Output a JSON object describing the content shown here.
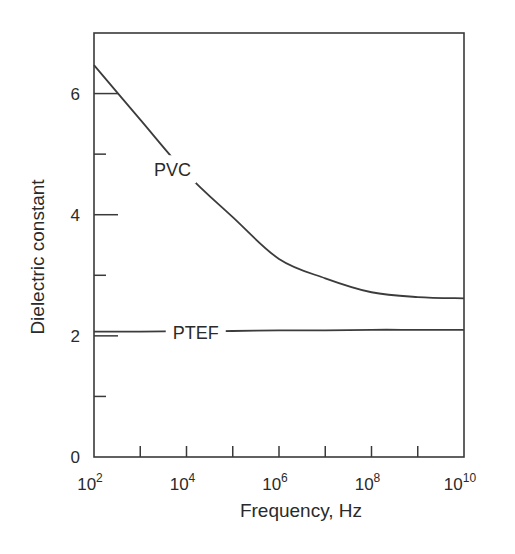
{
  "chart_data": {
    "type": "line",
    "title": "",
    "xlabel": "Frequency, Hz",
    "ylabel": "Dielectric constant",
    "xscale": "log",
    "xlim_log10": [
      2,
      10
    ],
    "ylim": [
      0,
      7
    ],
    "grid": false,
    "legend": "inline labels on curves",
    "x_ticks_log10": [
      2,
      4,
      6,
      8,
      10
    ],
    "x_minor_ticks_log10": [
      3,
      5,
      7,
      9
    ],
    "x_tick_labels": [
      {
        "base": "10",
        "exp": "2"
      },
      {
        "base": "10",
        "exp": "4"
      },
      {
        "base": "10",
        "exp": "6"
      },
      {
        "base": "10",
        "exp": "8"
      },
      {
        "base": "10",
        "exp": "10"
      }
    ],
    "y_ticks": [
      0,
      2,
      4,
      6
    ],
    "y_minor_ticks": [
      1,
      3,
      5
    ],
    "y_tick_labels": [
      "0",
      "2",
      "4",
      "6"
    ],
    "x_log10": [
      2,
      3,
      4,
      5,
      6,
      7,
      8,
      9,
      10
    ],
    "series": [
      {
        "name": "PVC",
        "values": [
          6.47,
          5.57,
          4.68,
          3.96,
          3.27,
          2.95,
          2.72,
          2.64,
          2.62
        ],
        "label_at_log10": 3.7,
        "label_value": 4.75
      },
      {
        "name": "PTEF",
        "values": [
          2.07,
          2.07,
          2.08,
          2.08,
          2.09,
          2.09,
          2.1,
          2.1,
          2.1
        ],
        "label_at_log10": 4.2,
        "label_value": 2.07
      }
    ]
  },
  "colors": {
    "axis": "#3a3a3a",
    "line": "#3c3c3c",
    "text": "#2a2a2a",
    "background": "#ffffff"
  }
}
